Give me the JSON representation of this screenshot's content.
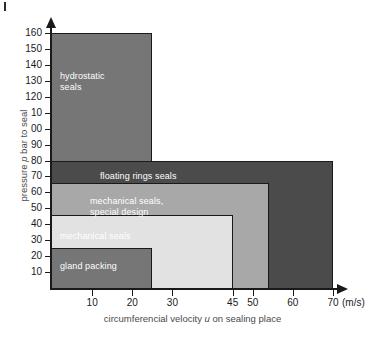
{
  "chart_data": {
    "type": "area",
    "title": "",
    "xlabel": "circumferencial velocity u on sealing place",
    "xlabel_prefix": "circumferencial velocity ",
    "xlabel_italic": "u",
    "xlabel_suffix": " on sealing place",
    "ylabel": "pressure p bar to seal",
    "ylabel_prefix": "pressure ",
    "ylabel_italic": "p",
    "ylabel_suffix": " bar to seal",
    "x_unit": "(m/s)",
    "xlim": [
      0,
      70
    ],
    "ylim": [
      0,
      160
    ],
    "grid": false,
    "legend": "none",
    "x_ticks": [
      {
        "value": 10,
        "label": "10"
      },
      {
        "value": 20,
        "label": "20"
      },
      {
        "value": 30,
        "label": "30"
      },
      {
        "value": 45,
        "label": "45"
      },
      {
        "value": 50,
        "label": "50"
      },
      {
        "value": 60,
        "label": "60"
      },
      {
        "value": 70,
        "label": "70"
      }
    ],
    "y_ticks": [
      {
        "value": 160,
        "label": "160"
      },
      {
        "value": 150,
        "label": "150"
      },
      {
        "value": 140,
        "label": "140"
      },
      {
        "value": 130,
        "label": "130"
      },
      {
        "value": 120,
        "label": "120"
      },
      {
        "value": 110,
        "label": "10"
      },
      {
        "value": 100,
        "label": "00"
      },
      {
        "value": 90,
        "label": "90"
      },
      {
        "value": 80,
        "label": "80"
      },
      {
        "value": 70,
        "label": "70"
      },
      {
        "value": 60,
        "label": "60"
      },
      {
        "value": 50,
        "label": "50"
      },
      {
        "value": 40,
        "label": "40"
      },
      {
        "value": 30,
        "label": "30"
      },
      {
        "value": 20,
        "label": "20"
      },
      {
        "value": 10,
        "label": "10"
      }
    ],
    "regions": [
      {
        "name": "hydrostatic seals",
        "label": "hydrostatic\nseals",
        "x_max": 25,
        "y_max": 160,
        "color": "#767676",
        "label_color": "#ffffff"
      },
      {
        "name": "floating rings seals",
        "label": "floating rings seals",
        "x_max": 70,
        "y_max": 80,
        "color": "#4b4b4b",
        "label_color": "#ffffff"
      },
      {
        "name": "mechanical seals, special design",
        "label": "mechanical seals,\nspecial design",
        "x_max": 54,
        "y_max": 66,
        "color": "#a8a8a8",
        "label_color": "#ffffff"
      },
      {
        "name": "mechanical seals",
        "label": "mechanical seals",
        "x_max": 45,
        "y_max": 46,
        "color": "#e2e2e2",
        "label_color": "#ffffff"
      },
      {
        "name": "gland packing",
        "label": "gland packing",
        "x_max": 25,
        "y_max": 25,
        "color": "#767676",
        "label_color": "#ffffff"
      }
    ]
  }
}
